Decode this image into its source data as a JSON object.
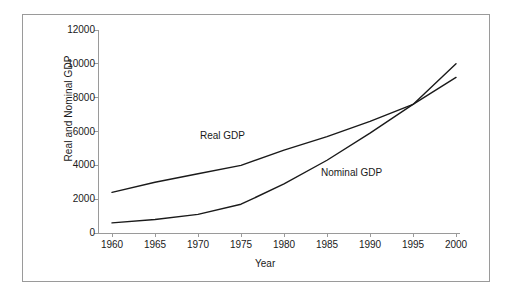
{
  "chart_data": {
    "type": "line",
    "title": "",
    "xlabel": "Year",
    "ylabel": "Real and Nominal GDP",
    "xlim": [
      1960,
      2000
    ],
    "ylim": [
      0,
      12000
    ],
    "grid": false,
    "legend_position": "inline-annotations",
    "x_tick_labels": [
      "1960",
      "1965",
      "1970",
      "1975",
      "1980",
      "1985",
      "1990",
      "1995",
      "2000"
    ],
    "y_tick_labels": [
      "0",
      "2000",
      "4000",
      "6000",
      "8000",
      "10000",
      "12000"
    ],
    "x": [
      1960,
      1965,
      1970,
      1975,
      1980,
      1985,
      1990,
      1995,
      2000
    ],
    "series": [
      {
        "name": "Real GDP",
        "color": "#1a1a1a",
        "values": [
          2400,
          3000,
          3500,
          4000,
          4900,
          5700,
          6600,
          7600,
          9200
        ]
      },
      {
        "name": "Nominal GDP",
        "color": "#1a1a1a",
        "values": [
          600,
          800,
          1100,
          1700,
          2900,
          4300,
          5900,
          7600,
          10000
        ]
      }
    ],
    "annotations": [
      {
        "text": "Real GDP",
        "x": 1976,
        "y": 5300
      },
      {
        "text": "Nominal GDP",
        "x": 1990,
        "y": 3600
      }
    ]
  },
  "axes": {
    "y_title": "Real and Nominal GDP",
    "x_title": "Year",
    "y_ticks": [
      "12000",
      "10000",
      "8000",
      "6000",
      "4000",
      "2000",
      "0"
    ],
    "x_ticks": [
      "1960",
      "1965",
      "1970",
      "1975",
      "1980",
      "1985",
      "1990",
      "1995",
      "2000"
    ]
  },
  "annotations": {
    "real_gdp": "Real GDP",
    "nominal_gdp": "Nominal GDP"
  },
  "colors": {
    "line": "#1a1a1a",
    "axis": "#9a9a9a",
    "frame": "#9a9a9a",
    "text": "#1a1a1a",
    "background": "#ffffff"
  }
}
